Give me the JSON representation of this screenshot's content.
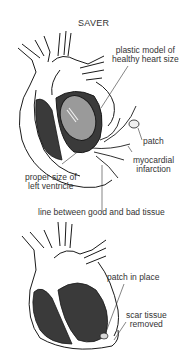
{
  "title": "SAVER",
  "top_figure": {
    "labels": {
      "plastic_model": [
        "plastic model of",
        "healthy heart size"
      ],
      "patch": "patch",
      "myocardial_infarction": [
        "myocardial",
        "infarction"
      ],
      "proper_size": [
        "proper size of",
        "left ventricle"
      ],
      "line_between": "line between good and bad tissue"
    }
  },
  "bottom_figure": {
    "labels": {
      "patch_in_place": "patch in place",
      "scar_tissue": [
        "scar tissue",
        "removed"
      ]
    }
  },
  "colors": {
    "outline": "#1a1a1a",
    "muscle": "#3a3a3a",
    "model": "#9a9a9a",
    "background": "#ffffff"
  }
}
